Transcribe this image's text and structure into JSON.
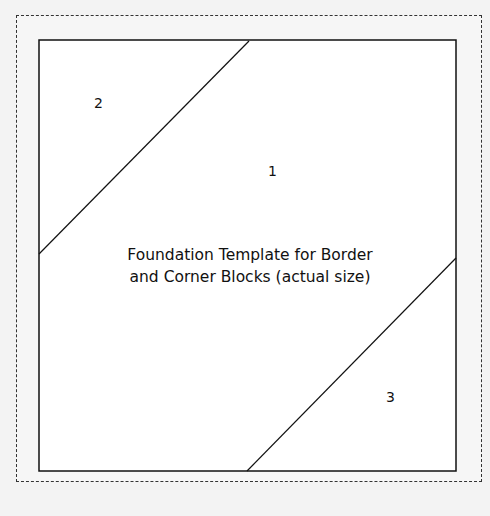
{
  "diagram": {
    "title_line1": "Foundation Template for Border",
    "title_line2": "and Corner Blocks (actual size)",
    "sections": [
      {
        "label": "1"
      },
      {
        "label": "2"
      },
      {
        "label": "3"
      }
    ]
  }
}
